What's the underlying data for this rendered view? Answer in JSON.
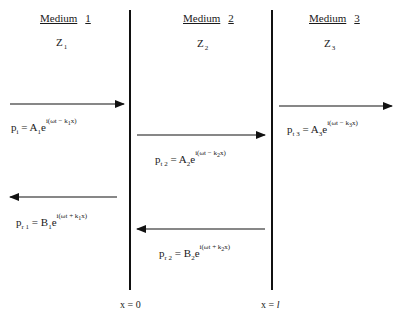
{
  "media": [
    {
      "title_word": "Medium",
      "title_num": "1",
      "z_symbol": "Z",
      "z_sub": "1"
    },
    {
      "title_word": "Medium",
      "title_num": "2",
      "z_symbol": "Z",
      "z_sub": "2"
    },
    {
      "title_word": "Medium",
      "title_num": "3",
      "z_symbol": "Z",
      "z_sub": "3"
    }
  ],
  "boundaries": [
    {
      "label_prefix": "x = ",
      "label_value": "0",
      "x_px": 130
    },
    {
      "label_prefix": "x = ",
      "label_value": "l",
      "x_px": 272
    }
  ],
  "waves": [
    {
      "id": "incident",
      "direction": "right",
      "p": "p",
      "p_sub": "i",
      "eq": " = ",
      "amp": "A",
      "amp_sub": "1",
      "e": "e",
      "exp_pre": "i(ωt − k",
      "exp_sub": "1",
      "exp_post": "x)"
    },
    {
      "id": "transmitted-2",
      "direction": "right",
      "p": "p",
      "p_sub": "t 2",
      "eq": " = ",
      "amp": "A",
      "amp_sub": "2",
      "e": "e",
      "exp_pre": "i(ωt − k",
      "exp_sub": "2",
      "exp_post": "x)"
    },
    {
      "id": "transmitted-3",
      "direction": "right",
      "p": "p",
      "p_sub": "t 3",
      "eq": " = ",
      "amp": "A",
      "amp_sub": "3",
      "e": "e",
      "exp_pre": "i(ωt − k",
      "exp_sub": "3",
      "exp_post": "x)"
    },
    {
      "id": "reflected-1",
      "direction": "left",
      "p": "p",
      "p_sub": "r 1",
      "eq": " = ",
      "amp": "B",
      "amp_sub": "1",
      "e": "e",
      "exp_pre": "i(ωt + k",
      "exp_sub": "1",
      "exp_post": "x)"
    },
    {
      "id": "reflected-2",
      "direction": "left",
      "p": "p",
      "p_sub": "r 2",
      "eq": " = ",
      "amp": "B",
      "amp_sub": "2",
      "e": "e",
      "exp_pre": "i(ωt + k",
      "exp_sub": "2",
      "exp_post": "x)"
    }
  ],
  "colors": {
    "line": "#111111",
    "text": "#1a1a1a",
    "background": "#ffffff"
  }
}
